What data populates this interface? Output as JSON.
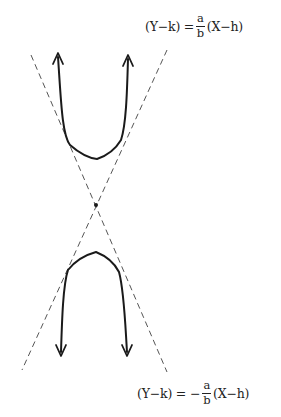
{
  "diagram": {
    "colors": {
      "curve": "#1a1a1a",
      "asymptote": "#555555",
      "text": "#222222",
      "background": "#ffffff"
    },
    "asymptote_upper_right": {
      "lhs": "(Y−k) =",
      "sign": "",
      "numerator": "a",
      "denominator": "b",
      "rhs": "(X−h)"
    },
    "asymptote_lower_right": {
      "lhs": "(Y−k) =",
      "sign": "−",
      "numerator": "a",
      "denominator": "b",
      "rhs": "(X−h)"
    },
    "elements": {
      "center": "center point (h, k)",
      "upper_branch": "upper branch opening upward",
      "lower_branch": "lower branch opening downward",
      "asymptotes": "two dashed asymptote lines crossing at center"
    }
  }
}
